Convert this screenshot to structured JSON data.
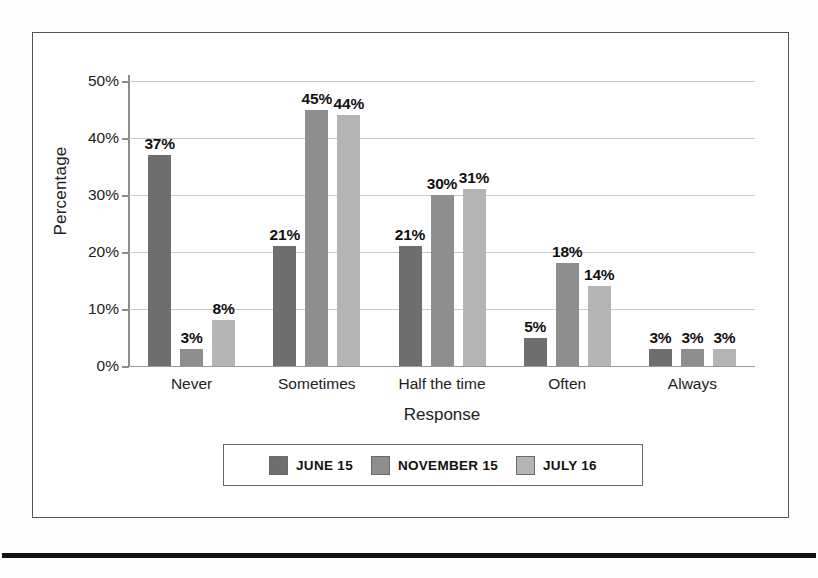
{
  "chart_data": {
    "type": "bar",
    "title": "",
    "xlabel": "Response",
    "ylabel": "Percentage",
    "categories": [
      "Never",
      "Sometimes",
      "Half the time",
      "Often",
      "Always"
    ],
    "series": [
      {
        "name": "JUNE 15",
        "color": "#6e6e6e",
        "values": [
          37,
          21,
          21,
          5,
          3
        ],
        "labels": [
          "37%",
          "21%",
          "21%",
          "5%",
          "3%"
        ]
      },
      {
        "name": "NOVEMBER 15",
        "color": "#8e8e8e",
        "values": [
          3,
          45,
          30,
          18,
          3
        ],
        "labels": [
          "3%",
          "45%",
          "30%",
          "18%",
          "3%"
        ]
      },
      {
        "name": "JULY 16",
        "color": "#b4b4b4",
        "values": [
          8,
          44,
          31,
          14,
          3
        ],
        "labels": [
          "8%",
          "44%",
          "31%",
          "14%",
          "3%"
        ]
      }
    ],
    "ylim": [
      0,
      50
    ],
    "yticks": [
      0,
      10,
      20,
      30,
      40,
      50
    ],
    "ytick_labels": [
      "0%",
      "10%",
      "20%",
      "30%",
      "40%",
      "50%"
    ],
    "grid": true,
    "legend_position": "bottom",
    "value_labels": true
  },
  "axes": {
    "y_title": "Percentage",
    "x_title": "Response"
  },
  "legend": {
    "entries": [
      {
        "label": "JUNE 15"
      },
      {
        "label": "NOVEMBER 15"
      },
      {
        "label": "JULY 16"
      }
    ]
  }
}
